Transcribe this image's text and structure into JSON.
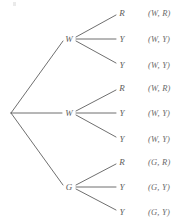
{
  "diagram": {
    "type": "probability-tree",
    "title": "",
    "background_color": "#ffffff",
    "line_color": "#5f5f5f",
    "text_color": "#5d5d5d",
    "root": {
      "label": "",
      "x": 11,
      "y": 113
    },
    "level1": [
      {
        "label": "W",
        "x": 69,
        "y": 39
      },
      {
        "label": "W",
        "x": 69,
        "y": 113
      },
      {
        "label": "G",
        "x": 69,
        "y": 187
      }
    ],
    "level2": [
      {
        "label": "R",
        "x": 122,
        "y": 13,
        "parent": 0
      },
      {
        "label": "Y",
        "x": 122,
        "y": 39,
        "parent": 0
      },
      {
        "label": "Y",
        "x": 122,
        "y": 65,
        "parent": 0
      },
      {
        "label": "R",
        "x": 122,
        "y": 88,
        "parent": 1
      },
      {
        "label": "Y",
        "x": 122,
        "y": 113,
        "parent": 1
      },
      {
        "label": "Y",
        "x": 122,
        "y": 139,
        "parent": 1
      },
      {
        "label": "R",
        "x": 122,
        "y": 162,
        "parent": 2
      },
      {
        "label": "Y",
        "x": 122,
        "y": 187,
        "parent": 2
      },
      {
        "label": "Y",
        "x": 122,
        "y": 212,
        "parent": 2
      }
    ],
    "outcomes": [
      {
        "label": "(W, R)",
        "x": 148,
        "y": 13
      },
      {
        "label": "(W, Y)",
        "x": 148,
        "y": 39
      },
      {
        "label": "(W, Y)",
        "x": 148,
        "y": 65
      },
      {
        "label": "(W, R)",
        "x": 148,
        "y": 88
      },
      {
        "label": "(W, Y)",
        "x": 148,
        "y": 113
      },
      {
        "label": "(W, Y)",
        "x": 148,
        "y": 139
      },
      {
        "label": "(G, R)",
        "x": 148,
        "y": 162
      },
      {
        "label": "(G, Y)",
        "x": 148,
        "y": 187
      },
      {
        "label": "(G, Y)",
        "x": 148,
        "y": 212
      }
    ]
  }
}
